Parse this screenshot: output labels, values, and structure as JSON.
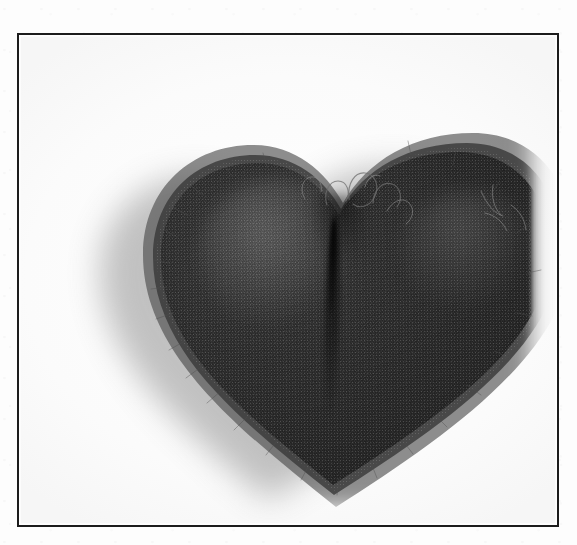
{
  "page": {
    "kind": "scanned-photographic-plate",
    "background_color": "#fdfdfd",
    "width_px": 577,
    "height_px": 545
  },
  "frame": {
    "name": "plate-border",
    "color": "#1c1c1c",
    "stroke_px": 2,
    "left_px": 17,
    "top_px": 33,
    "width_px": 542,
    "height_px": 494,
    "interior_color": "#fcfcfc"
  },
  "photograph": {
    "subject": "felted wool heart",
    "rendering": "grayscale halftone scan",
    "subject_tone": "#2b2b2b",
    "halo_tone": "#7b7b7b",
    "field_tone": "#fbfbfb",
    "features": [
      {
        "name": "left-lobe",
        "description": "rounded upper-left lobe, highest point"
      },
      {
        "name": "right-lobe",
        "description": "broader, lower upper-right lobe"
      },
      {
        "name": "center-cleft",
        "description": "notch between the two lobes"
      },
      {
        "name": "center-seam",
        "description": "vertical crease running down from the cleft"
      },
      {
        "name": "bottom-tip",
        "description": "softly rounded lower point"
      },
      {
        "name": "fibre-fringe",
        "description": "fuzzy loose wool fibres along the silhouette"
      },
      {
        "name": "stray-loops",
        "description": "loose yarn loops above the cleft and right lobe"
      },
      {
        "name": "cast-shadow",
        "description": "soft grey shadow to the lower-left of the object"
      }
    ]
  },
  "caption": {
    "alt_text": "Black-and-white halftone photograph of a fuzzy felted wool heart, centred inside a thin ruled rectangular border."
  }
}
